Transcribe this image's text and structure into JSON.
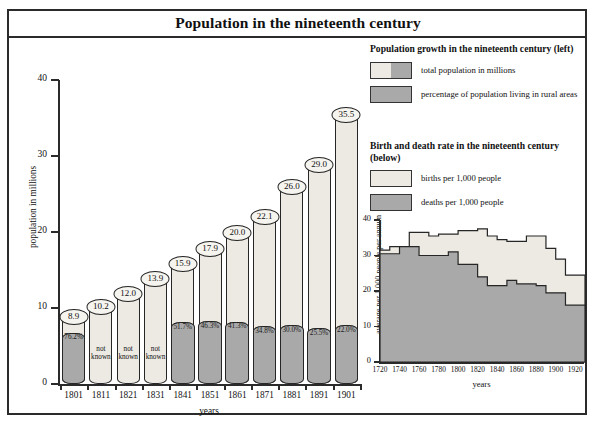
{
  "title": "Population in the nineteenth century",
  "legends": [
    {
      "name": "population-growth",
      "title": "Population growth in the nineteenth century (left)",
      "items": [
        {
          "label": "total population in millions",
          "swatch": "split-light-dark"
        },
        {
          "label": "percentage of population living in rural areas",
          "swatch": "dark"
        }
      ]
    },
    {
      "name": "birth-death-rate",
      "title": "Birth and death rate in the nineteenth century (below)",
      "items": [
        {
          "label": "births per 1,000 people",
          "swatch": "light"
        },
        {
          "label": "deaths per 1,000 people",
          "swatch": "dark"
        }
      ]
    }
  ],
  "colors": {
    "light": "#eceae3",
    "dark": "#a9a9a9",
    "outline": "#262626",
    "frame": "#2b2b2b"
  },
  "chart_data": [
    {
      "type": "bar",
      "name": "population-growth-chart",
      "title": "Population growth in the nineteenth century (left)",
      "xlabel": "years",
      "ylabel": "population in millions",
      "ylim": [
        0,
        40
      ],
      "yticks": [
        0,
        10,
        20,
        30,
        40
      ],
      "grid": false,
      "categories": [
        "1801",
        "1811",
        "1821",
        "1831",
        "1841",
        "1851",
        "1861",
        "1871",
        "1881",
        "1891",
        "1901"
      ],
      "series": [
        {
          "name": "total population in millions",
          "values": [
            8.9,
            10.2,
            12.0,
            13.9,
            15.9,
            17.9,
            20.0,
            22.1,
            26.0,
            29.0,
            35.5
          ]
        },
        {
          "name": "percentage of population living in rural areas",
          "unit": "%",
          "labels": [
            "76.2%",
            "not known",
            "not known",
            "not known",
            "51.7%",
            "46.3%",
            "41.3%",
            "34.8%",
            "30.0%",
            "25.5%",
            "22.0%"
          ],
          "values": [
            76.2,
            null,
            null,
            null,
            51.7,
            46.3,
            41.3,
            34.8,
            30.0,
            25.5,
            22.0
          ]
        }
      ]
    },
    {
      "type": "area",
      "name": "birth-death-rate-chart",
      "title": "Birth and death rate in the nineteenth century (below)",
      "xlabel": "years",
      "ylabel": "average per 1,000 people per annum",
      "ylim": [
        0,
        40
      ],
      "yticks": [
        0,
        10,
        20,
        30,
        40
      ],
      "xticks": [
        1720,
        1740,
        1760,
        1780,
        1800,
        1820,
        1840,
        1860,
        1880,
        1900,
        1920
      ],
      "xlim": [
        1720,
        1930
      ],
      "grid": false,
      "step": true,
      "x": [
        1720,
        1730,
        1740,
        1750,
        1760,
        1770,
        1780,
        1790,
        1800,
        1810,
        1820,
        1830,
        1840,
        1850,
        1860,
        1870,
        1880,
        1890,
        1900,
        1910,
        1920
      ],
      "series": [
        {
          "name": "births per 1,000 people",
          "values": [
            31.5,
            32.5,
            32.5,
            36.5,
            36.5,
            35.5,
            36.0,
            36.0,
            37.0,
            37.0,
            37.5,
            35.5,
            34.5,
            34.0,
            34.0,
            35.5,
            35.5,
            32.0,
            29.0,
            24.5,
            24.5
          ]
        },
        {
          "name": "deaths per 1,000 people",
          "values": [
            30.5,
            30.5,
            32.5,
            32.5,
            30.0,
            30.0,
            30.0,
            31.0,
            27.5,
            27.5,
            24.0,
            21.5,
            21.5,
            23.0,
            22.0,
            22.0,
            21.5,
            19.5,
            19.5,
            16.0,
            16.0
          ]
        }
      ]
    }
  ]
}
